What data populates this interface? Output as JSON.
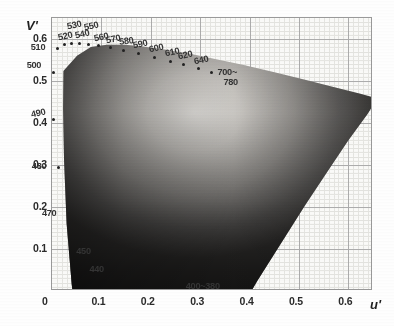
{
  "chart_data": {
    "type": "scatter",
    "title": "",
    "xlabel": "u'",
    "ylabel": "V'",
    "xlim": [
      0,
      0.65
    ],
    "ylim": [
      0,
      0.65
    ],
    "grid": true,
    "legend": "none",
    "xticks": [
      "0",
      "0.1",
      "0.2",
      "0.3",
      "0.4",
      "0.5",
      "0.6"
    ],
    "xtick_values": [
      0,
      0.1,
      0.2,
      0.3,
      0.4,
      0.5,
      0.6
    ],
    "yticks": [
      "0.1",
      "0.2",
      "0.3",
      "0.4",
      "0.5",
      "0.6"
    ],
    "ytick_values": [
      0.1,
      0.2,
      0.3,
      0.4,
      0.5,
      0.6
    ],
    "annotations": [
      {
        "label": "510",
        "u": 0.0118,
        "v": 0.5764
      },
      {
        "label": "520",
        "u": 0.0257,
        "v": 0.5869
      },
      {
        "label": "530",
        "u": 0.0399,
        "v": 0.5896
      },
      {
        "label": "540",
        "u": 0.0564,
        "v": 0.5896
      },
      {
        "label": "550",
        "u": 0.0748,
        "v": 0.5877
      },
      {
        "label": "560",
        "u": 0.0951,
        "v": 0.5844
      },
      {
        "label": "570",
        "u": 0.1185,
        "v": 0.5796
      },
      {
        "label": "580",
        "u": 0.1453,
        "v": 0.5731
      },
      {
        "label": "590",
        "u": 0.1748,
        "v": 0.5657
      },
      {
        "label": "600",
        "u": 0.2074,
        "v": 0.5565
      },
      {
        "label": "610",
        "u": 0.2397,
        "v": 0.5472
      },
      {
        "label": "620",
        "u": 0.2658,
        "v": 0.5393
      },
      {
        "label": "640",
        "u": 0.2974,
        "v": 0.5296
      },
      {
        "label": "700~",
        "u": 0.323,
        "v": 0.521
      },
      {
        "label": "780",
        "u": 0.323,
        "v": 0.521
      },
      {
        "label": "500",
        "u": 0.0035,
        "v": 0.5212
      },
      {
        "label": "490",
        "u": 0.0035,
        "v": 0.4074
      },
      {
        "label": "480",
        "u": 0.0139,
        "v": 0.295
      },
      {
        "label": "470",
        "u": 0.0343,
        "v": 0.1913
      },
      {
        "label": "450",
        "u": 0.0917,
        "v": 0.0767
      },
      {
        "label": "440",
        "u": 0.1183,
        "v": 0.0561
      },
      {
        "label": "400~380",
        "u": 0.2568,
        "v": 0.0165
      }
    ]
  },
  "axes": {
    "y_title": "V'",
    "x_title": "u'",
    "y_labels": [
      "0.6",
      "0.5",
      "0.4",
      "0.3",
      "0.2",
      "0.1"
    ],
    "x_labels": [
      "0",
      "0.1",
      "0.2",
      "0.3",
      "0.4",
      "0.5",
      "0.6"
    ]
  },
  "locus_labels": {
    "top": [
      "520",
      "530",
      "540",
      "550",
      "560",
      "570",
      "580",
      "590",
      "600",
      "610",
      "620",
      "640"
    ],
    "right_line1": "700~",
    "right_line2": "780",
    "left": [
      "510",
      "500",
      "490",
      "480",
      "470"
    ],
    "bottom": [
      "450",
      "440",
      "400~380"
    ]
  },
  "colors": {
    "background": "#ffffff",
    "plot_background": "#fbfbf9",
    "grid_major": "#adadad",
    "grid_minor": "#e6e6e2",
    "frame": "#9a9a9a",
    "text": "#2b2b2b",
    "marker": "#222222"
  }
}
